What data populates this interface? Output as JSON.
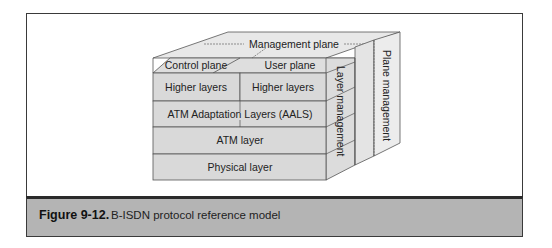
{
  "figure": {
    "number": "Figure 9-12.",
    "caption": "B-ISDN protocol reference model"
  },
  "diagram": {
    "top_labels": {
      "management_plane": "Management plane",
      "control_plane": "Control plane",
      "user_plane": "User plane"
    },
    "front_layers": {
      "higher_layers_control": "Higher layers",
      "higher_layers_user": "Higher layers",
      "aal": "ATM Adaptation Layers (AALS)",
      "atm": "ATM layer",
      "physical": "Physical layer"
    },
    "side_labels": {
      "layer_management": "Layer management",
      "plane_management": "Plane management"
    },
    "colors": {
      "face_front": "#d9d9d9",
      "face_top": "#e6e6e6",
      "face_side": "#e2e2e2",
      "stroke": "#555555",
      "caption_band": "#b4b4b4"
    }
  }
}
